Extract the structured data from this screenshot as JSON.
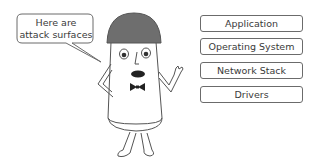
{
  "speech_bubble": {
    "line1": "Here are",
    "line2": "attack surfaces"
  },
  "layers": [
    {
      "label": "Application"
    },
    {
      "label": "Operating System"
    },
    {
      "label": "Network Stack"
    },
    {
      "label": "Drivers"
    }
  ],
  "colors": {
    "helmet": "#6e6e6e",
    "outline": "#555555",
    "text": "#3a3a3a",
    "box_border": "#6b6b6b"
  }
}
